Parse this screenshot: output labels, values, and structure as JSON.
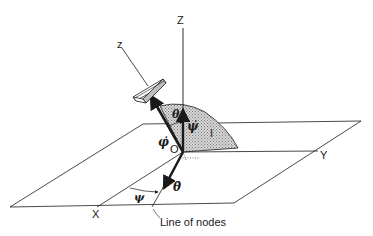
{
  "diagram": {
    "type": "euler-angles-precessing-top",
    "labels": {
      "space_z": "Z",
      "body_z": "z",
      "x_axis": "X",
      "y_axis": "Y",
      "origin": "O",
      "inertia_plane": "I",
      "theta": "θ",
      "theta_dot": "θ̇",
      "phi_dot": "φ̇",
      "psi_dot": "ψ̇",
      "psi": "ψ",
      "line_of_nodes": "Line of nodes"
    },
    "colors": {
      "line": "#1a1a1a",
      "shade": "#b8b8b8",
      "background": "#ffffff"
    }
  }
}
